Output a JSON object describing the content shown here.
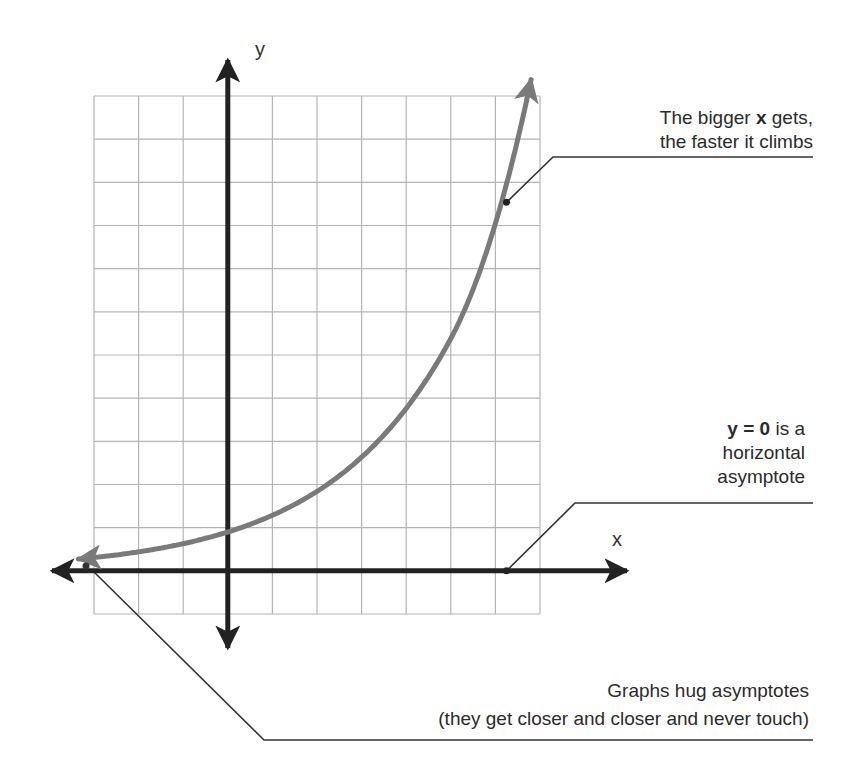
{
  "figure": {
    "type": "exponential-growth-diagram",
    "axes": {
      "x_label": "x",
      "y_label": "y"
    },
    "grid": {
      "x_min": -3,
      "x_max": 7,
      "y_min": -1,
      "y_max": 11,
      "step": 1
    },
    "colors": {
      "grid": "#b5b5b5",
      "axes": "#222222",
      "curve": "#7a7a7a",
      "leader": "#333333",
      "text": "#2b2b2b"
    },
    "curve": {
      "description": "exponential growth curve approaching y = 0 on the left",
      "formula_approx": "y = 0.9 * 1.43^x",
      "sample_points": [
        {
          "x": -3,
          "y": 0.12
        },
        {
          "x": -2,
          "y": 0.35
        },
        {
          "x": -1,
          "y": 0.6
        },
        {
          "x": 0,
          "y": 0.85
        },
        {
          "x": 1,
          "y": 1.3
        },
        {
          "x": 2,
          "y": 1.9
        },
        {
          "x": 3,
          "y": 2.7
        },
        {
          "x": 4,
          "y": 3.8
        },
        {
          "x": 5,
          "y": 5.0
        },
        {
          "x": 6,
          "y": 8.0
        },
        {
          "x": 6.84,
          "y": 11.2
        }
      ]
    },
    "marked_points": [
      {
        "name": "climb-point",
        "x": 6.25,
        "y": 8.54
      },
      {
        "name": "asymptote-point",
        "x": 6.25,
        "y": 0
      },
      {
        "name": "hug-point",
        "x": -3.2,
        "y": 0.1
      }
    ]
  },
  "annotations": {
    "climb": {
      "line1_pre": "The bigger ",
      "line1_bold": "x",
      "line1_post": " gets,",
      "line2": "the faster it climbs"
    },
    "asymptote": {
      "line1_bold": "y = 0",
      "line1_post": " is a",
      "line2": "horizontal",
      "line3": "asymptote"
    },
    "hug": {
      "line1": "Graphs hug asymptotes",
      "line2": "(they get closer and closer and never touch)"
    }
  }
}
